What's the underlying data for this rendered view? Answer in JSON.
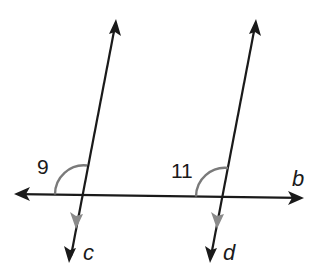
{
  "diagram": {
    "colors": {
      "line": "#1a1a1a",
      "arc": "#7a7a7a",
      "parallel_mark": "#8a8a8a",
      "background": "#ffffff"
    },
    "lines": [
      {
        "id": "b",
        "label": "b",
        "kind": "transversal",
        "from": [
          15,
          194
        ],
        "to": [
          303,
          198
        ]
      },
      {
        "id": "c",
        "label": "c",
        "kind": "parallel",
        "from": [
          116,
          20
        ],
        "to": [
          70,
          262
        ]
      },
      {
        "id": "d",
        "label": "d",
        "kind": "parallel",
        "from": [
          256,
          20
        ],
        "to": [
          210,
          262
        ]
      }
    ],
    "angles": [
      {
        "id": "9",
        "label": "9",
        "vertex": [
          81,
          195
        ],
        "between": [
          "b-left",
          "c-up"
        ]
      },
      {
        "id": "11",
        "label": "11",
        "vertex": [
          222,
          197
        ],
        "between": [
          "b-left",
          "d-up"
        ]
      }
    ],
    "labels": {
      "angle_9": "9",
      "angle_11": "11",
      "line_b": "b",
      "line_c": "c",
      "line_d": "d"
    }
  }
}
